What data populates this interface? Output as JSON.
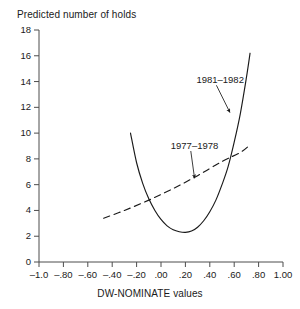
{
  "chart_data": {
    "type": "line",
    "title": "Predicted number of holds",
    "xlabel": "DW-NOMINATE values",
    "ylabel": "Predicted number of holds",
    "xlim": [
      -1.0,
      1.0
    ],
    "ylim": [
      0,
      18
    ],
    "grid": false,
    "legend_position": "inline-annotations",
    "xticks": [
      -1.0,
      -0.8,
      -0.6,
      -0.4,
      -0.2,
      0.0,
      0.2,
      0.4,
      0.6,
      0.8,
      1.0
    ],
    "xtick_labels": [
      "–1.0",
      "–.80",
      "–.60",
      "–.40",
      "–.20",
      ".00",
      ".20",
      ".40",
      ".60",
      ".80",
      "1.00"
    ],
    "yticks": [
      0,
      2,
      4,
      6,
      8,
      10,
      12,
      14,
      16,
      18
    ],
    "ytick_labels": [
      "0",
      "2",
      "4",
      "6",
      "8",
      "10",
      "12",
      "14",
      "16",
      "18"
    ],
    "series": [
      {
        "name": "1981–1982",
        "style": "solid",
        "color": "#1a1a1a",
        "annotation": "1981–1982",
        "x": [
          -0.25,
          -0.2,
          -0.15,
          -0.1,
          -0.05,
          0.0,
          0.05,
          0.1,
          0.15,
          0.2,
          0.25,
          0.3,
          0.35,
          0.4,
          0.45,
          0.5,
          0.55,
          0.6,
          0.65,
          0.7,
          0.73
        ],
        "y": [
          10.0,
          7.7,
          6.1,
          4.9,
          4.0,
          3.3,
          2.8,
          2.5,
          2.35,
          2.3,
          2.4,
          2.7,
          3.2,
          3.9,
          4.8,
          6.0,
          7.4,
          9.3,
          11.5,
          14.3,
          16.2
        ]
      },
      {
        "name": "1977–1978",
        "style": "dashed",
        "color": "#1a1a1a",
        "annotation": "1977–1978",
        "x": [
          -0.47,
          -0.3,
          -0.1,
          0.1,
          0.3,
          0.5,
          0.65,
          0.73
        ],
        "y": [
          3.4,
          4.0,
          4.8,
          5.7,
          6.7,
          7.8,
          8.5,
          9.1
        ]
      }
    ],
    "annotations": [
      {
        "text": "1981–1982",
        "label_x": 0.29,
        "label_y": 14.1,
        "arrow_to_x": 0.565,
        "arrow_to_y": 11.6
      },
      {
        "text": "1977–1978",
        "label_x": 0.08,
        "label_y": 9.0,
        "arrow_to_x": 0.275,
        "arrow_to_y": 6.5
      }
    ]
  }
}
